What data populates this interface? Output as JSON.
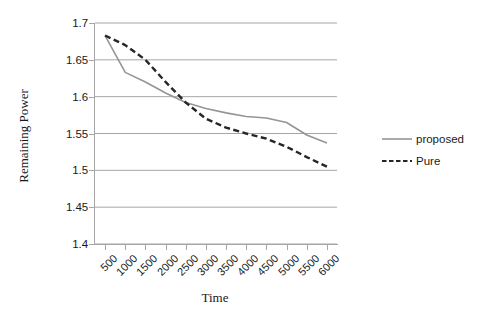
{
  "chart_data": {
    "type": "line",
    "title": "",
    "xlabel": "Time",
    "ylabel": "Remaining Power",
    "categories": [
      "500",
      "1000",
      "1500",
      "2000",
      "2500",
      "3000",
      "3500",
      "4000",
      "4500",
      "5000",
      "5500",
      "6000"
    ],
    "ylim": [
      1.4,
      1.7
    ],
    "ytick_labels": [
      "1.7",
      "1.65",
      "1.6",
      "1.55",
      "1.5",
      "1.45",
      "1.4"
    ],
    "ytick_values": [
      1.7,
      1.65,
      1.6,
      1.55,
      1.5,
      1.45,
      1.4
    ],
    "ystep": 0.05,
    "grid": "horizontal",
    "legend_position": "right",
    "series": [
      {
        "name": "proposed",
        "style": "solid",
        "color": "#959595",
        "values": [
          1.683,
          1.633,
          1.62,
          1.605,
          1.592,
          1.584,
          1.578,
          1.573,
          1.571,
          1.565,
          1.548,
          1.537
        ]
      },
      {
        "name": "Pure",
        "style": "dashed",
        "color": "#262626",
        "values": [
          1.683,
          1.67,
          1.65,
          1.62,
          1.592,
          1.57,
          1.558,
          1.55,
          1.543,
          1.532,
          1.518,
          1.505
        ]
      }
    ],
    "colors": {
      "grid": "#a6a6a6",
      "axis": "#a6a6a6",
      "text": "#1a1a1a",
      "background": "#ffffff"
    }
  }
}
